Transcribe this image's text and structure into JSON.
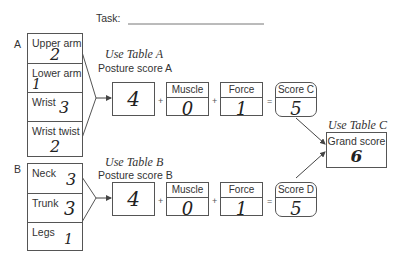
{
  "task": {
    "label": "Task:"
  },
  "section_a": {
    "letter": "A",
    "items": [
      {
        "label": "Upper arm",
        "value": "2"
      },
      {
        "label": "Lower arm",
        "value": "1"
      },
      {
        "label": "Wrist",
        "value": "3"
      },
      {
        "label": "Wrist twist",
        "value": "2"
      }
    ],
    "table_ref": "Use Table A",
    "posture_label": "Posture score A",
    "posture_value": "4",
    "muscle_label": "Muscle",
    "muscle_value": "0",
    "force_label": "Force",
    "force_value": "1",
    "score_label": "Score C",
    "score_value": "5"
  },
  "section_b": {
    "letter": "B",
    "items": [
      {
        "label": "Neck",
        "value": "3"
      },
      {
        "label": "Trunk",
        "value": "3"
      },
      {
        "label": "Legs",
        "value": "1"
      }
    ],
    "table_ref": "Use Table B",
    "posture_label": "Posture score B",
    "posture_value": "4",
    "muscle_label": "Muscle",
    "muscle_value": "0",
    "force_label": "Force",
    "force_value": "1",
    "score_label": "Score D",
    "score_value": "5"
  },
  "grand": {
    "table_ref": "Use Table C",
    "label": "Grand score",
    "value": "6"
  },
  "operators": {
    "plus": "+",
    "equals": "="
  }
}
